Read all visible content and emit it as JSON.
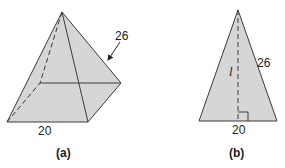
{
  "figure": {
    "colors": {
      "fill": "#d6d6d6",
      "stroke": "#3a3a3a",
      "text": "#222222"
    },
    "panel_a": {
      "caption": "(a)",
      "description": "Square-based pyramid",
      "slant_edge_label": "26",
      "base_edge_label": "20"
    },
    "panel_b": {
      "caption": "(b)",
      "description": "Isosceles triangular face with slant height",
      "side_label": "26",
      "height_label": "l",
      "base_label": "20"
    }
  }
}
